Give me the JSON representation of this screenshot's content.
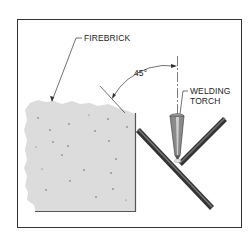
{
  "figure": {
    "labels": {
      "firebrick": "FIREBRICK",
      "angle": "45°",
      "torch_line1": "WELDING",
      "torch_line2": "TORCH"
    },
    "colors": {
      "frame": "#333333",
      "firebrick_fill": "#dcdcdc",
      "firebrick_dots": "#666666",
      "rod": "#4a4a4a",
      "torch": "#8a8a8a",
      "background": "#ffffff"
    }
  }
}
